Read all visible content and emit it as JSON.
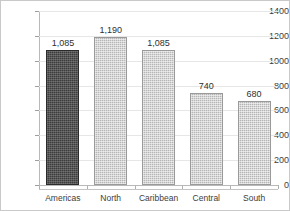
{
  "chart_data": {
    "type": "bar",
    "title": "",
    "xlabel": "",
    "ylabel": "",
    "categories": [
      "Americas",
      "North",
      "Caribbean",
      "Central",
      "South"
    ],
    "values": [
      1085,
      1190,
      1085,
      740,
      680
    ],
    "value_labels": [
      "1,085",
      "1,190",
      "1,085",
      "740",
      "680"
    ],
    "ylim": [
      0,
      1400
    ],
    "ytick_step": 200,
    "yticks": [
      0,
      200,
      400,
      600,
      800,
      1000,
      1200,
      1400
    ],
    "ytick_labels": [
      "0",
      "200",
      "400",
      "600",
      "800",
      "1000",
      "1200",
      "1400"
    ],
    "grid": true,
    "grid_axis": "y",
    "legend": false,
    "legend_position": "none",
    "series": [
      {
        "name": "",
        "values": [
          1085,
          1190,
          1085,
          740,
          680
        ]
      }
    ],
    "bar_colors": [
      "#3c3c3c",
      "#b5b5b5",
      "#b5b5b5",
      "#b5b5b5",
      "#b5b5b5"
    ],
    "highlight_category": "Americas",
    "colors": {
      "highlight_bar": "#3c3c3c",
      "bar": "#b5b5b5",
      "bar_border": "#9a9a9a",
      "gridline": "#e6e6e6",
      "axis_line": "#b9b9b9",
      "tick_mark": "#9e9e9e",
      "text": "#3d3d3d",
      "frame_border": "#c9c9c9",
      "background": "#ffffff"
    }
  }
}
